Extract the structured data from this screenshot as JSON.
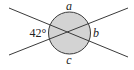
{
  "diagram": {
    "type": "intersecting-lines-angles",
    "colors": {
      "line": "#3a3a3a",
      "circle_fill": "#d3d3d3",
      "circle_stroke": "#3a3a3a",
      "text": "#222222"
    },
    "labels": {
      "top": "a",
      "left": "42°",
      "right": "b",
      "bottom": "c"
    }
  }
}
